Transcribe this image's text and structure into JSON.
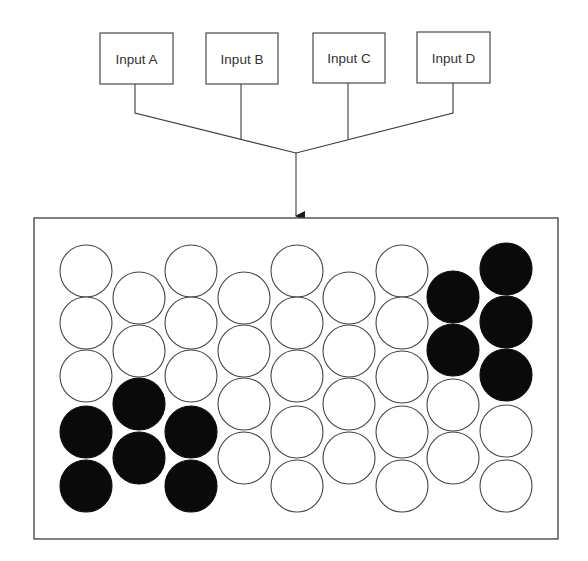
{
  "diagram": {
    "inputs": [
      {
        "label": "Input A",
        "x": 100,
        "y": 33,
        "w": 73,
        "h": 51,
        "stem_x": 135
      },
      {
        "label": "Input B",
        "x": 206,
        "y": 33,
        "w": 72,
        "h": 51,
        "stem_x": 241
      },
      {
        "label": "Input C",
        "x": 313,
        "y": 33,
        "w": 72,
        "h": 50,
        "stem_x": 348
      },
      {
        "label": "Input D",
        "x": 417,
        "y": 32,
        "w": 73,
        "h": 51,
        "stem_x": 453
      }
    ],
    "merge_point": {
      "x": 296,
      "y": 153
    },
    "arrow": {
      "from_y": 153,
      "to_y": 217
    },
    "container": {
      "x": 34,
      "y": 218,
      "w": 524,
      "h": 321
    },
    "colors": {
      "line": "#3c3c3c",
      "filled": "#0a0a0a",
      "empty": "#ffffff"
    },
    "circle_radius": 26,
    "columns": [
      {
        "x": 86,
        "cells": [
          {
            "y": 271,
            "filled": false
          },
          {
            "y": 323,
            "filled": false
          },
          {
            "y": 376,
            "filled": false
          },
          {
            "y": 432,
            "filled": true
          },
          {
            "y": 486,
            "filled": true
          }
        ]
      },
      {
        "x": 139,
        "cells": [
          {
            "y": 298,
            "filled": false
          },
          {
            "y": 351,
            "filled": false
          },
          {
            "y": 404,
            "filled": true
          },
          {
            "y": 458,
            "filled": true
          }
        ]
      },
      {
        "x": 191,
        "cells": [
          {
            "y": 271,
            "filled": false
          },
          {
            "y": 323,
            "filled": false
          },
          {
            "y": 376,
            "filled": false
          },
          {
            "y": 432,
            "filled": true
          },
          {
            "y": 486,
            "filled": true
          }
        ]
      },
      {
        "x": 244,
        "cells": [
          {
            "y": 298,
            "filled": false
          },
          {
            "y": 351,
            "filled": false
          },
          {
            "y": 404,
            "filled": false
          },
          {
            "y": 458,
            "filled": false
          }
        ]
      },
      {
        "x": 297,
        "cells": [
          {
            "y": 271,
            "filled": false
          },
          {
            "y": 323,
            "filled": false
          },
          {
            "y": 376,
            "filled": false
          },
          {
            "y": 432,
            "filled": false
          },
          {
            "y": 486,
            "filled": false
          }
        ]
      },
      {
        "x": 349,
        "cells": [
          {
            "y": 298,
            "filled": false
          },
          {
            "y": 351,
            "filled": false
          },
          {
            "y": 404,
            "filled": false
          },
          {
            "y": 458,
            "filled": false
          }
        ]
      },
      {
        "x": 402,
        "cells": [
          {
            "y": 271,
            "filled": false
          },
          {
            "y": 323,
            "filled": false
          },
          {
            "y": 377,
            "filled": false
          },
          {
            "y": 432,
            "filled": false
          },
          {
            "y": 486,
            "filled": false
          }
        ]
      },
      {
        "x": 453,
        "cells": [
          {
            "y": 297,
            "filled": true
          },
          {
            "y": 350,
            "filled": true
          },
          {
            "y": 405,
            "filled": false
          },
          {
            "y": 458,
            "filled": false
          }
        ]
      },
      {
        "x": 506,
        "cells": [
          {
            "y": 269,
            "filled": true
          },
          {
            "y": 322,
            "filled": true
          },
          {
            "y": 375,
            "filled": true
          },
          {
            "y": 431,
            "filled": false
          },
          {
            "y": 486,
            "filled": false
          }
        ]
      }
    ]
  }
}
